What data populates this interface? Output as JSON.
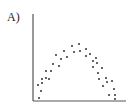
{
  "panel_label": "A)",
  "chart_data": {
    "type": "scatter",
    "title": "",
    "xlabel": "",
    "ylabel": "",
    "grid": false,
    "legend": null,
    "axes": {
      "x_axis": {
        "x1": 33,
        "x2": 126,
        "y": 101
      },
      "y_axis": {
        "x": 33,
        "y1": 14,
        "y2": 101
      }
    },
    "note": "Unlabeled axes; points form an inverted-U (parabolic) pattern. Coordinates below are pixel positions (x right, y down).",
    "points": [
      [
        38,
        85
      ],
      [
        39,
        98
      ],
      [
        41,
        91
      ],
      [
        42,
        83
      ],
      [
        42,
        79
      ],
      [
        46,
        78
      ],
      [
        46,
        71
      ],
      [
        49,
        79
      ],
      [
        51,
        71
      ],
      [
        53,
        64
      ],
      [
        56,
        55
      ],
      [
        59,
        66
      ],
      [
        61,
        59
      ],
      [
        64,
        51
      ],
      [
        67,
        57
      ],
      [
        72,
        46
      ],
      [
        74,
        52
      ],
      [
        79,
        44
      ],
      [
        80,
        51
      ],
      [
        86,
        49
      ],
      [
        86,
        56
      ],
      [
        90,
        54
      ],
      [
        93,
        61
      ],
      [
        96,
        58
      ],
      [
        97,
        63
      ],
      [
        93,
        67
      ],
      [
        98,
        73
      ],
      [
        99,
        79
      ],
      [
        102,
        68
      ],
      [
        103,
        86
      ],
      [
        106,
        78
      ],
      [
        107,
        82
      ],
      [
        109,
        95
      ],
      [
        112,
        81
      ],
      [
        114,
        89
      ],
      [
        115,
        95
      ],
      [
        115,
        99
      ]
    ],
    "colors": {
      "point": "#333333",
      "axis": "#555555"
    }
  }
}
